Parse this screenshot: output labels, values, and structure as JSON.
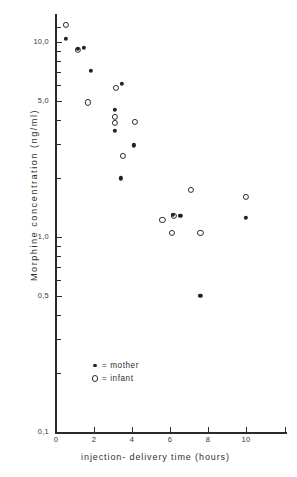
{
  "chart_data": {
    "type": "scatter",
    "title": "",
    "xlabel": "injection- delivery  time  (hours)",
    "ylabel": "Morphine  concentration  (ng/ml)",
    "xlim": [
      0,
      11.2
    ],
    "ylim": [
      0.1,
      13.0
    ],
    "yscale": "log",
    "xscale": "linear",
    "grid": false,
    "legend_position": "inside lower-left",
    "x_ticks": [
      "0",
      "2",
      "4",
      "6",
      "8",
      "10"
    ],
    "x_tick_values": [
      0,
      2,
      4,
      6,
      8,
      10
    ],
    "y_ticks": [
      "0,1",
      "0,5",
      "1,0",
      "5,0",
      "10,0"
    ],
    "y_tick_values": [
      0.1,
      0.5,
      1.0,
      5.0,
      10.0
    ],
    "y_minor_tick_values": [
      0.2,
      0.3,
      0.4,
      0.6,
      0.7,
      0.8,
      0.9,
      2.0,
      3.0,
      4.0,
      6.0,
      7.0,
      8.0,
      9.0,
      12.0
    ],
    "series": [
      {
        "name": "mother",
        "marker": "filled-circle",
        "color": "#222222",
        "points": [
          {
            "x": 0.5,
            "y": 10.4
          },
          {
            "x": 1.15,
            "y": 9.2
          },
          {
            "x": 1.45,
            "y": 9.3
          },
          {
            "x": 1.85,
            "y": 7.1
          },
          {
            "x": 3.45,
            "y": 6.1
          },
          {
            "x": 3.1,
            "y": 4.5
          },
          {
            "x": 3.1,
            "y": 3.5
          },
          {
            "x": 4.1,
            "y": 2.95
          },
          {
            "x": 3.4,
            "y": 2.0
          },
          {
            "x": 6.15,
            "y": 1.3
          },
          {
            "x": 6.55,
            "y": 1.28
          },
          {
            "x": 7.6,
            "y": 0.5
          },
          {
            "x": 10.0,
            "y": 1.25
          }
        ]
      },
      {
        "name": "infant",
        "marker": "open-circle",
        "color": "#2b2b2b",
        "points": [
          {
            "x": 0.5,
            "y": 12.2
          },
          {
            "x": 1.15,
            "y": 9.1
          },
          {
            "x": 1.7,
            "y": 4.9
          },
          {
            "x": 3.15,
            "y": 5.8
          },
          {
            "x": 3.1,
            "y": 4.15
          },
          {
            "x": 3.1,
            "y": 3.85
          },
          {
            "x": 4.15,
            "y": 3.9
          },
          {
            "x": 3.5,
            "y": 2.6
          },
          {
            "x": 5.6,
            "y": 1.23
          },
          {
            "x": 6.2,
            "y": 1.28
          },
          {
            "x": 6.1,
            "y": 1.05
          },
          {
            "x": 7.1,
            "y": 1.75
          },
          {
            "x": 7.6,
            "y": 1.05
          },
          {
            "x": 10.0,
            "y": 1.6
          }
        ]
      }
    ],
    "legend_entries": [
      {
        "marker": "filled-circle",
        "label": "= mother"
      },
      {
        "marker": "open-circle",
        "label": "= infant"
      }
    ]
  }
}
